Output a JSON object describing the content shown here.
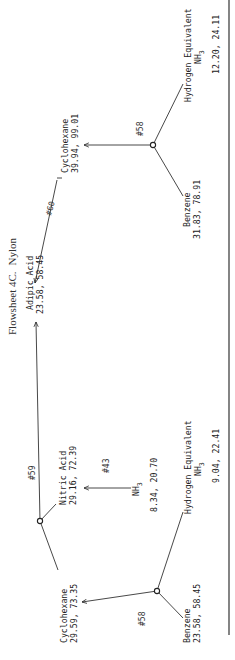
{
  "title": "Flowsheet 4C.",
  "subtitle": "Nylon",
  "processes": [
    {
      "id": "p58_top",
      "label": "#58"
    },
    {
      "id": "p60",
      "label": "#60"
    },
    {
      "id": "p59",
      "label": "#59"
    },
    {
      "id": "p43",
      "label": "#43"
    },
    {
      "id": "p58_bottom",
      "label": "#58"
    }
  ],
  "nodes": {
    "hydrogen_equiv_top": {
      "name": "Hydrogen Equivalent",
      "formula": "NH",
      "subscript": "3",
      "values": "12.20, 24.11"
    },
    "benzene_top": {
      "name": "Benzene",
      "values": "31.83, 78.91"
    },
    "cyclohexane_top": {
      "name": "Cyclohexane",
      "values": "39.94, 99.01"
    },
    "adipic_acid": {
      "name": "Adipic Acid",
      "values": "23.58, 58.45"
    },
    "nitric_acid": {
      "name": "Nitric Acid",
      "values": "29.16, 72.39"
    },
    "nh3_mid": {
      "formula": "NH",
      "subscript": "3",
      "values": "8.34, 20.70"
    },
    "hydrogen_equiv_bottom": {
      "name": "Hydrogen Equivalent",
      "formula": "NH",
      "subscript": "3",
      "values": "9.04, 22.41"
    },
    "cyclohexane_bottom": {
      "name": "Cyclohexane",
      "values": "29.59, 73.35"
    },
    "benzene_bottom": {
      "name": "Benzene",
      "values": "23.58, 58.45"
    }
  },
  "colors": {
    "ink": "#222222",
    "paper": "#ffffff"
  }
}
